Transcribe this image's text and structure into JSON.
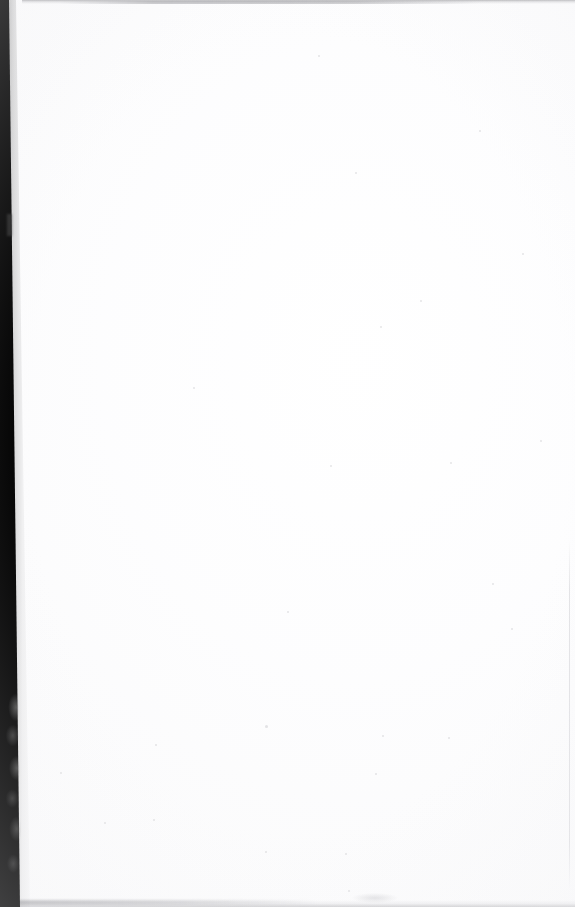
{
  "document": {
    "type": "scanned-page",
    "content_state": "blank",
    "visible_text": "",
    "width_px": 575,
    "height_px": 907,
    "background_color": "#ffffff",
    "paper_color": "#fefefe"
  },
  "artifacts": {
    "gutter_edge": {
      "name": "left-scanner-gutter-edge",
      "color": "#000000",
      "position": "left",
      "width_top_px": 9,
      "width_bottom_px": 20,
      "description": "black scanner bed / book gutter band tapering wider toward the bottom"
    },
    "gutter_texture": {
      "name": "gutter-grey-mottling",
      "color": "#969696",
      "start_y_px": 690,
      "end_y_px": 907,
      "description": "mottled grey texture on the lower portion of the dark left band"
    },
    "top_edge_shadow": {
      "name": "top-edge-shadow-line",
      "color": "#82828a",
      "height_px": 4,
      "description": "faint grey horizontal shadow along the top edge of the scan"
    },
    "bottom_edge_shadow": {
      "name": "bottom-edge-shadow-line",
      "color": "#9696a0",
      "height_px": 7,
      "description": "faint grey shadow with slight curve along the bottom edge"
    },
    "right_edge_line": {
      "name": "right-page-boundary-line",
      "color": "#cdcdd2",
      "start_y_px": 540,
      "end_y_px": 890,
      "description": "very faint vertical page boundary visible in the lower right"
    }
  },
  "specks": [
    {
      "x": 193,
      "y": 387,
      "size": 2
    },
    {
      "x": 380,
      "y": 326,
      "size": 2
    },
    {
      "x": 420,
      "y": 300,
      "size": 2
    },
    {
      "x": 355,
      "y": 172,
      "size": 2
    },
    {
      "x": 330,
      "y": 465,
      "size": 2
    },
    {
      "x": 450,
      "y": 462,
      "size": 2
    },
    {
      "x": 287,
      "y": 611,
      "size": 2
    },
    {
      "x": 492,
      "y": 583,
      "size": 2
    },
    {
      "x": 511,
      "y": 628,
      "size": 2
    },
    {
      "x": 155,
      "y": 744,
      "size": 2
    },
    {
      "x": 265,
      "y": 725,
      "size": 3
    },
    {
      "x": 382,
      "y": 735,
      "size": 2
    },
    {
      "x": 448,
      "y": 737,
      "size": 2
    },
    {
      "x": 153,
      "y": 819,
      "size": 2
    },
    {
      "x": 104,
      "y": 822,
      "size": 2
    },
    {
      "x": 265,
      "y": 851,
      "size": 2
    },
    {
      "x": 345,
      "y": 853,
      "size": 2
    },
    {
      "x": 348,
      "y": 890,
      "size": 2
    },
    {
      "x": 375,
      "y": 773,
      "size": 2
    },
    {
      "x": 60,
      "y": 772,
      "size": 2
    },
    {
      "x": 540,
      "y": 440,
      "size": 2
    },
    {
      "x": 318,
      "y": 55,
      "size": 2
    },
    {
      "x": 522,
      "y": 253,
      "size": 2
    },
    {
      "x": 479,
      "y": 130,
      "size": 2
    }
  ]
}
